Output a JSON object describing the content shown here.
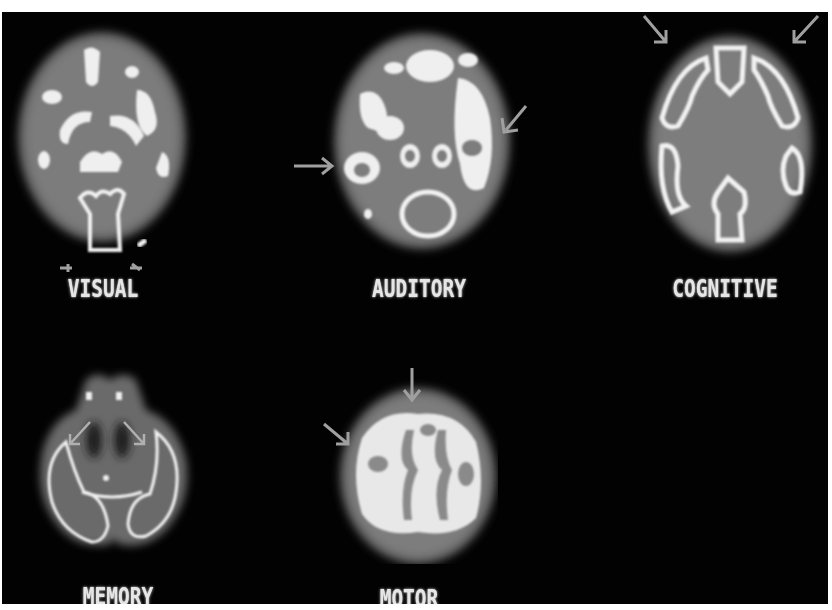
{
  "figure": {
    "background": "#020202",
    "frame_color": "#ffffff",
    "scans": [
      {
        "id": "visual",
        "label": "VISUAL",
        "arrows": 2,
        "arrow_position": "bottom (occipital)"
      },
      {
        "id": "auditory",
        "label": "AUDITORY",
        "arrows": 2,
        "arrow_position": "left and right sides (temporal)"
      },
      {
        "id": "cognitive",
        "label": "COGNITIVE",
        "arrows": 2,
        "arrow_position": "top (frontal)"
      },
      {
        "id": "memory",
        "label": "MEMORY",
        "arrows": 2,
        "arrow_position": "inner medial temporal"
      },
      {
        "id": "motor",
        "label": "MOTOR",
        "arrows": 2,
        "arrow_position": "top and upper-left"
      }
    ],
    "colors": {
      "brain_fill": "#7a7a7a",
      "brain_edge": "#4a4a4a",
      "activation": "#f0f0f0",
      "arrow": "#9a9a9a"
    }
  }
}
